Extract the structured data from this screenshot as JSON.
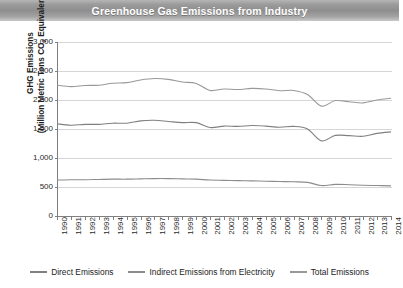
{
  "header": {
    "title": "Greenhouse Gas Emissions from Industry"
  },
  "axis": {
    "ylabel_line1": "GHG Emissions",
    "ylabel_line2_pre": "(Million Metric Tons CO",
    "ylabel_line2_sub": "2",
    "ylabel_line2_post": " Equivalent)"
  },
  "legend": {
    "items": [
      {
        "label": "Direct Emissions",
        "color": "#808080"
      },
      {
        "label": "Indirect Emissions from Electricity",
        "color": "#8c8c8c"
      },
      {
        "label": "Total Emissions",
        "color": "#999999"
      }
    ]
  },
  "chart_data": {
    "type": "line",
    "title": "Greenhouse Gas Emissions from Industry",
    "xlabel": "",
    "ylabel": "GHG Emissions (Million Metric Tons CO2 Equivalent)",
    "ylim": [
      0,
      3000
    ],
    "yticks": [
      3000,
      2500,
      2000,
      1500,
      1000,
      500,
      0
    ],
    "ytick_labels": [
      "3,000",
      "2,500",
      "2,000",
      "1,500",
      "1,000",
      "500",
      "0"
    ],
    "grid": true,
    "legend_position": "bottom",
    "x": [
      1990,
      1991,
      1992,
      1993,
      1994,
      1995,
      1996,
      1997,
      1998,
      1999,
      2000,
      2001,
      2002,
      2003,
      2004,
      2005,
      2006,
      2007,
      2008,
      2009,
      2010,
      2011,
      2012,
      2013,
      2014
    ],
    "xtick_labels": [
      "1990",
      "1991",
      "1992",
      "1993",
      "1994",
      "1995",
      "1996",
      "1997",
      "1998",
      "1999",
      "2000",
      "2001",
      "2002",
      "2003",
      "2004",
      "2005",
      "2006",
      "2007",
      "2008",
      "2009",
      "2010",
      "2011",
      "2012",
      "2013",
      "2014"
    ],
    "series": [
      {
        "name": "Total Emissions",
        "color": "#999999",
        "values": [
          2255,
          2230,
          2250,
          2255,
          2290,
          2300,
          2345,
          2370,
          2355,
          2310,
          2285,
          2165,
          2190,
          2180,
          2200,
          2190,
          2160,
          2165,
          2095,
          1895,
          1990,
          1970,
          1950,
          2000,
          2030
        ]
      },
      {
        "name": "Direct Emissions",
        "color": "#808080",
        "values": [
          1590,
          1565,
          1580,
          1580,
          1600,
          1600,
          1640,
          1650,
          1630,
          1610,
          1610,
          1525,
          1550,
          1545,
          1560,
          1550,
          1530,
          1545,
          1500,
          1295,
          1390,
          1385,
          1375,
          1425,
          1450
        ]
      },
      {
        "name": "Indirect Emissions from Electricity",
        "color": "#8c8c8c",
        "values": [
          620,
          625,
          625,
          630,
          635,
          635,
          640,
          645,
          645,
          640,
          635,
          620,
          615,
          610,
          605,
          600,
          595,
          590,
          580,
          525,
          545,
          540,
          530,
          525,
          520
        ]
      }
    ]
  }
}
